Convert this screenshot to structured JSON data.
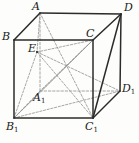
{
  "figure": {
    "type": "geometry-diagram",
    "stroke_color": "#2b2b2b",
    "hidden_stroke_color": "#8a8a8a",
    "background": "#fdfdfb"
  },
  "labels": {
    "A": {
      "text": "A",
      "sub": ""
    },
    "B": {
      "text": "B",
      "sub": ""
    },
    "C": {
      "text": "C",
      "sub": ""
    },
    "D": {
      "text": "D",
      "sub": ""
    },
    "E": {
      "text": "E",
      "sub": ""
    },
    "A1": {
      "text": "A",
      "sub": "1"
    },
    "B1": {
      "text": "B",
      "sub": "1"
    },
    "C1": {
      "text": "C",
      "sub": "1"
    },
    "D1": {
      "text": "D",
      "sub": "1"
    }
  },
  "vertices": {
    "A": {
      "x": 40,
      "y": 13
    },
    "B": {
      "x": 14,
      "y": 40
    },
    "C": {
      "x": 93,
      "y": 40
    },
    "D": {
      "x": 121,
      "y": 14
    },
    "E": {
      "x": 37,
      "y": 52
    },
    "A1": {
      "x": 40,
      "y": 91
    },
    "B1": {
      "x": 14,
      "y": 118
    },
    "C1": {
      "x": 93,
      "y": 118
    },
    "D1": {
      "x": 120,
      "y": 91
    }
  },
  "edges_solid": [
    {
      "name": "edge-A-B",
      "from": "A",
      "to": "B"
    },
    {
      "name": "edge-A-D",
      "from": "A",
      "to": "D"
    },
    {
      "name": "edge-B-C",
      "from": "B",
      "to": "C"
    },
    {
      "name": "edge-C-D",
      "from": "C",
      "to": "D"
    },
    {
      "name": "edge-B-B1",
      "from": "B",
      "to": "B1"
    },
    {
      "name": "edge-C-C1",
      "from": "C",
      "to": "C1"
    },
    {
      "name": "edge-D-D1",
      "from": "D",
      "to": "D1"
    },
    {
      "name": "edge-B1-C1",
      "from": "B1",
      "to": "C1"
    },
    {
      "name": "edge-C1-D1",
      "from": "C1",
      "to": "D1"
    },
    {
      "name": "diagonal-D-C1",
      "from": "D",
      "to": "C1"
    }
  ],
  "edges_dashed": [
    {
      "name": "edge-A-A1",
      "from": "A",
      "to": "A1"
    },
    {
      "name": "edge-A1-B1",
      "from": "A1",
      "to": "B1"
    },
    {
      "name": "edge-A1-D1",
      "from": "A1",
      "to": "D1"
    }
  ],
  "internal_dashed": [
    {
      "name": "segment-B1-E",
      "from": "B1",
      "to": "E"
    },
    {
      "name": "segment-B1-C",
      "from": "B1",
      "to": "C"
    },
    {
      "name": "segment-B1-D1",
      "from": "B1",
      "to": "D1"
    },
    {
      "name": "segment-E-C1",
      "from": "E",
      "to": "C1"
    },
    {
      "name": "segment-E-D1",
      "from": "E",
      "to": "D1"
    },
    {
      "name": "segment-E-C",
      "from": "E",
      "to": "C"
    },
    {
      "name": "segment-C-A1",
      "from": "C",
      "to": "A1"
    },
    {
      "name": "segment-A-C1",
      "from": "A",
      "to": "C1"
    },
    {
      "name": "segment-A-E",
      "from": "A",
      "to": "E"
    },
    {
      "name": "segment-C-C1-mid",
      "from": "C",
      "to": "B1"
    }
  ],
  "label_positions": {
    "A": {
      "x": 32,
      "y": 1
    },
    "B": {
      "x": 2,
      "y": 31
    },
    "C": {
      "x": 86,
      "y": 28
    },
    "D": {
      "x": 124,
      "y": 2
    },
    "E": {
      "x": 28,
      "y": 43
    },
    "A1": {
      "x": 33,
      "y": 92
    },
    "B1": {
      "x": 6,
      "y": 121
    },
    "C1": {
      "x": 85,
      "y": 121
    },
    "D1": {
      "x": 122,
      "y": 83
    }
  }
}
